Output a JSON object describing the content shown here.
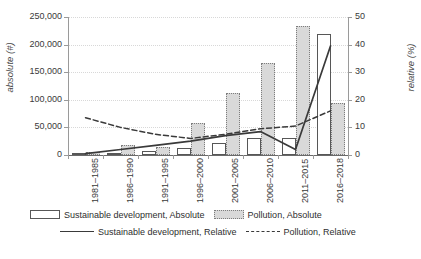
{
  "chart_data": {
    "type": "bar",
    "title": "",
    "subtitle": "",
    "xlabel": "",
    "ylabel": "absolute (#)",
    "y2label": "relative (%)",
    "ylim": [
      0,
      250000
    ],
    "y2lim": [
      0,
      50
    ],
    "yticks": [
      "0",
      "50,000",
      "100,000",
      "150,000",
      "200,000",
      "250,000"
    ],
    "ytick_values": [
      0,
      50000,
      100000,
      150000,
      200000,
      250000
    ],
    "y2ticks": [
      "0",
      "10",
      "20",
      "30",
      "40",
      "50"
    ],
    "y2tick_values": [
      0,
      10,
      20,
      30,
      40,
      50
    ],
    "grid": true,
    "grid_axis": "y",
    "legend_position": "bottom",
    "categories": [
      "1981–1985",
      "1986–1990",
      "1991–1995",
      "1996–2000",
      "2001–2005",
      "2006–2010",
      "2011–2015",
      "2016–2018"
    ],
    "series": [
      {
        "name": "Sustainable development, Absolute",
        "kind": "bar",
        "axis": "left",
        "fill": "#ffffff",
        "stroke": "#575757",
        "values": [
          1000,
          3000,
          8000,
          13000,
          22000,
          30000,
          31000,
          220000
        ]
      },
      {
        "name": "Pollution, Absolute",
        "kind": "bar",
        "axis": "left",
        "fill": "#d9d9d9",
        "stroke": "#7d7d7d",
        "values": [
          6000,
          18000,
          14000,
          58000,
          112000,
          167000,
          233000,
          95000
        ]
      },
      {
        "name": "Sustainable development, Relative",
        "kind": "line",
        "axis": "right",
        "style": "solid",
        "stroke": "#3a3a3a",
        "values": [
          0.5,
          2.0,
          3.5,
          5.0,
          7.0,
          8.5,
          2.0,
          39.5
        ]
      },
      {
        "name": "Pollution, Relative",
        "kind": "line",
        "axis": "right",
        "style": "dashed",
        "stroke": "#3a3a3a",
        "values": [
          13.5,
          10.0,
          7.5,
          6.0,
          7.5,
          9.5,
          10.5,
          16.0
        ]
      }
    ]
  },
  "legend": {
    "entries": [
      {
        "label": "Sustainable development, Absolute",
        "marker": "bar-outline-swatch"
      },
      {
        "label": "Pollution, Absolute",
        "marker": "bar-filled-swatch"
      },
      {
        "label": "Sustainable development, Relative",
        "marker": "solid-line-swatch"
      },
      {
        "label": "Pollution, Relative",
        "marker": "dashed-line-swatch"
      }
    ]
  },
  "caption": ""
}
